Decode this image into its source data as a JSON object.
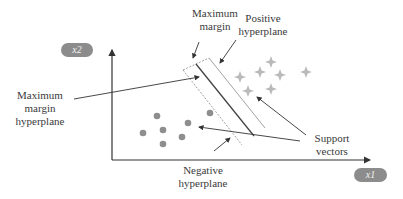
{
  "diagram": {
    "axes": {
      "x_label": "x1",
      "y_label": "x2"
    },
    "labels": {
      "max_margin": [
        "Maximum",
        "margin"
      ],
      "positive_hyperplane": [
        "Positive",
        "hyperplane"
      ],
      "max_margin_hyperplane": [
        "Maximum",
        "margin",
        "hyperplane"
      ],
      "support_vectors": [
        "Support",
        "vectors"
      ],
      "negative_hyperplane": [
        "Negative",
        "hyperplane"
      ]
    },
    "classes": {
      "positive": {
        "marker": "four-point-star",
        "color": "#b8b8b8",
        "count": 7
      },
      "negative": {
        "marker": "circle",
        "color": "#8e8e8e",
        "count": 8
      }
    },
    "colors": {
      "axis": "#333333",
      "hyperplane": "#444444",
      "margin_line": "#777777",
      "pill_bg": "#8c8c8c"
    }
  }
}
